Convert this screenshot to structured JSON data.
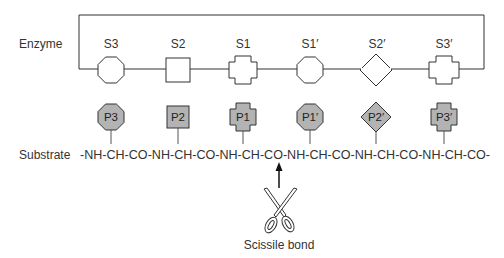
{
  "labels": {
    "enzyme": "Enzyme",
    "substrate": "Substrate",
    "scissile": "Scissile bond",
    "chain": "-NH-CH-CO-NH-CH-CO-NH-CH-CO-NH-CH-CO-NH-CH-CO-NH-CH-CO-"
  },
  "subsites": [
    {
      "label": "S3",
      "shape": "octagon"
    },
    {
      "label": "S2",
      "shape": "square"
    },
    {
      "label": "S1",
      "shape": "cross"
    },
    {
      "label": "S1′",
      "shape": "octagon"
    },
    {
      "label": "S2′",
      "shape": "diamond"
    },
    {
      "label": "S3′",
      "shape": "cross"
    }
  ],
  "residues": [
    {
      "label": "P3",
      "shape": "octagon"
    },
    {
      "label": "P2",
      "shape": "square"
    },
    {
      "label": "P1",
      "shape": "cross"
    },
    {
      "label": "P1′",
      "shape": "octagon"
    },
    {
      "label": "P2′",
      "shape": "diamond"
    },
    {
      "label": "P3′",
      "shape": "cross"
    }
  ],
  "colors": {
    "line": "#333333",
    "enzyme_fill": "#ffffff",
    "residue_fill": "#b3b3b3"
  }
}
